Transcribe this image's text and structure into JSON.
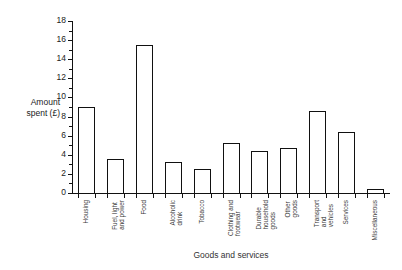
{
  "chart_data": {
    "type": "bar",
    "title": "",
    "xlabel": "Goods and services",
    "ylabel_line1": "Amount",
    "ylabel_line2": "spent (£)",
    "ylim": [
      0,
      18
    ],
    "ytick_step": 2,
    "ytick_labels": [
      "0",
      "2",
      "4",
      "6",
      "8",
      "10",
      "12",
      "14",
      "16",
      "18"
    ],
    "ytick_values": [
      0,
      2,
      4,
      6,
      8,
      10,
      12,
      14,
      16,
      18
    ],
    "grid": false,
    "legend": false,
    "categories": [
      "Housing",
      "Fuel, light and power",
      "Food",
      "Alcoholic drink",
      "Tobacco",
      "Clothing and footwear",
      "Durable household goods",
      "Other goods",
      "Transport and vehicles",
      "Services",
      "Miscellaneous"
    ],
    "category_lines": [
      [
        "Housing"
      ],
      [
        "Fuel, light",
        "and power"
      ],
      [
        "Food"
      ],
      [
        "Alcoholic",
        "drink"
      ],
      [
        "Tobacco"
      ],
      [
        "Clothing and",
        "footwear"
      ],
      [
        "Durable",
        "household",
        "goods"
      ],
      [
        "Other",
        "goods"
      ],
      [
        "Transport",
        "and",
        "vehicles"
      ],
      [
        "Services"
      ],
      [
        "Miscellaneous"
      ]
    ],
    "values": [
      9.0,
      3.6,
      15.5,
      3.2,
      2.5,
      5.2,
      4.4,
      4.75,
      8.6,
      6.35,
      0.45
    ],
    "bar_fill": "#ffffff",
    "bar_edge": "#111111",
    "axis_color": "#111111"
  }
}
